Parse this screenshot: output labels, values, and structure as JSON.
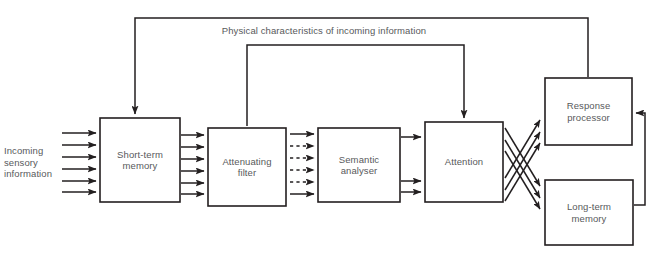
{
  "diagram": {
    "type": "flow-diagram",
    "colors": {
      "background": "#ffffff",
      "stroke": "#231f20",
      "text": "#58595b"
    },
    "boxes": [
      {
        "id": "short-term-memory",
        "label": "Short-term\nmemory",
        "x": 100,
        "y": 118,
        "w": 80,
        "h": 84
      },
      {
        "id": "attenuating-filter",
        "label": "Attenuating\nfilter",
        "x": 208,
        "y": 128,
        "w": 78,
        "h": 78
      },
      {
        "id": "semantic-analyser",
        "label": "Semantic\nanalyser",
        "x": 318,
        "y": 128,
        "w": 82,
        "h": 74
      },
      {
        "id": "attention",
        "label": "Attention",
        "x": 425,
        "y": 122,
        "w": 78,
        "h": 80
      },
      {
        "id": "response-processor",
        "label": "Response\nprocessor",
        "x": 545,
        "y": 78,
        "w": 87,
        "h": 67
      },
      {
        "id": "long-term-memory",
        "label": "Long-term\nmemory",
        "x": 545,
        "y": 180,
        "w": 88,
        "h": 65
      }
    ],
    "labels": {
      "incoming": "Incoming\nsensory\ninformation",
      "feedback": "Physical characteristics of incoming information"
    },
    "channels": {
      "input_arrow_count": 6,
      "stm_to_filter_count": 6,
      "filter_to_analyser_count": 6,
      "filter_to_analyser_dashed": [
        2,
        3,
        4,
        5
      ],
      "analyser_to_attention_count": 3,
      "attention_to_response_count": 3,
      "attention_to_ltm_count": 3
    },
    "feedback_paths": [
      {
        "id": "outer-feedback",
        "from": "response-processor",
        "to": "short-term-memory"
      },
      {
        "id": "inner-feedback",
        "from": "attention",
        "to": "attenuating-filter"
      },
      {
        "id": "ltm-to-response",
        "from": "long-term-memory",
        "to": "response-processor"
      }
    ]
  }
}
